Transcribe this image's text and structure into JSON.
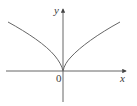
{
  "figure": {
    "y_axis_label": "y",
    "x_axis_label": "x",
    "origin_label": "0",
    "colors": {
      "axis": "#555555",
      "curve": "#666666",
      "background": "#ffffff"
    },
    "curve_description": "Cusp curve symmetric about the y-axis, passing through the origin, increasing as |x| grows (shape like y = |x|^(2/3))"
  }
}
